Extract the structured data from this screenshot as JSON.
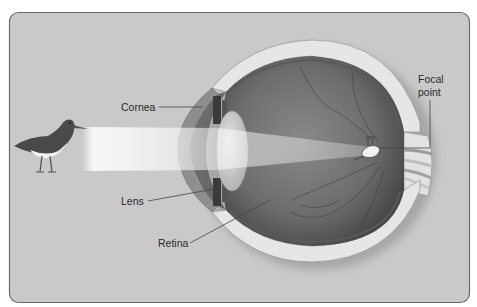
{
  "figure": {
    "colors": {
      "panel_bg": "#c9c9c9",
      "panel_border": "#6a6a6a",
      "sclera": "#e6e6e6",
      "eye_interior": "#6e6e6e",
      "light_beam": "#f4f4f4",
      "leader_line": "#444444",
      "label_text": "#2a2a2a"
    }
  },
  "labels": {
    "cornea": "Cornea",
    "lens": "Lens",
    "retina": "Retina",
    "focal_point_line1": "Focal",
    "focal_point_line2": "point"
  },
  "elements": {
    "object": "bird (wading shorebird, facing right)",
    "image_on_retina": "small inverted bird at focal point"
  }
}
